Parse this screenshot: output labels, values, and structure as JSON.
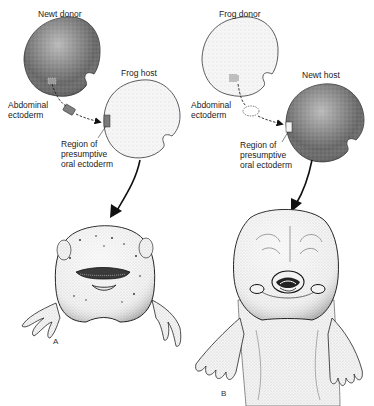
{
  "panels": [
    {
      "id": "A",
      "letter": "A",
      "donor_label": "Newt donor",
      "host_label": "Frog host",
      "tissue_label": "Abdominal\nectoderm",
      "target_label": "Region of\npresumptive\noral ectoderm",
      "donor_color": "#6a6a6a",
      "host_color": "#f1f1f1",
      "result": "frog tadpole head with newt-type balancers"
    },
    {
      "id": "B",
      "letter": "B",
      "donor_label": "Frog donor",
      "host_label": "Newt host",
      "tissue_label": "Abdominal\nectoderm",
      "target_label": "Region of\npresumptive\noral ectoderm",
      "donor_color": "#eeeeee",
      "host_color": "#6a6a6a",
      "result": "newt larva head with frog-type suckers and horny jaws"
    }
  ]
}
